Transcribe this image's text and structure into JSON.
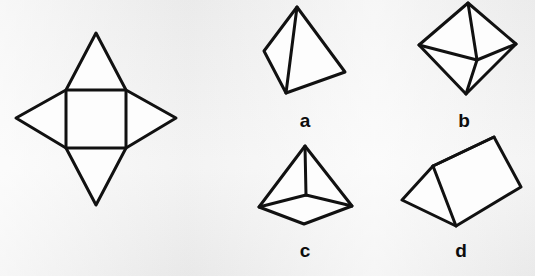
{
  "page": {
    "background_color": "#f1f1f1",
    "ink_color": "#111111",
    "face_fill_color": "#fdfdfd",
    "width": 535,
    "height": 276
  },
  "question_figure": {
    "name": "square-pyramid-net",
    "description": "Net made of a central square with four congruent triangles attached to each side, forming a four-pointed star",
    "shape_type": "net",
    "square": {
      "left": 66,
      "top": 90,
      "right": 126,
      "bottom": 148
    },
    "tips": {
      "top": {
        "x": 96,
        "y": 33
      },
      "right": {
        "x": 176,
        "y": 118
      },
      "bottom": {
        "x": 96,
        "y": 205
      },
      "left": {
        "x": 16,
        "y": 118
      }
    },
    "face_count": 5,
    "triangle_count": 4,
    "square_count": 1
  },
  "options": [
    {
      "id": "a",
      "label": "a",
      "solid_name": "tetrahedron",
      "description": "Triangular pyramid with four triangular faces, tilted",
      "label_position": {
        "x": 305,
        "y": 111
      },
      "vertices": {
        "apex": {
          "x": 297,
          "y": 7
        },
        "left": {
          "x": 264,
          "y": 51
        },
        "front": {
          "x": 286,
          "y": 93
        },
        "right": {
          "x": 345,
          "y": 72
        }
      }
    },
    {
      "id": "b",
      "label": "b",
      "solid_name": "octahedron",
      "description": "Two square pyramids joined base to base, eight triangular faces",
      "label_position": {
        "x": 464,
        "y": 111
      },
      "vertices": {
        "top": {
          "x": 468,
          "y": 3
        },
        "left": {
          "x": 419,
          "y": 45
        },
        "right": {
          "x": 516,
          "y": 44
        },
        "bottom": {
          "x": 466,
          "y": 94
        },
        "center": {
          "x": 477,
          "y": 60
        }
      }
    },
    {
      "id": "c",
      "label": "c",
      "solid_name": "square pyramid",
      "description": "Pyramid with a square base and four triangular faces",
      "label_position": {
        "x": 305,
        "y": 241
      },
      "vertices": {
        "apex": {
          "x": 305,
          "y": 146
        },
        "base_left": {
          "x": 259,
          "y": 207
        },
        "base_right": {
          "x": 352,
          "y": 206
        },
        "base_front": {
          "x": 304,
          "y": 224
        },
        "base_center": {
          "x": 306,
          "y": 195
        }
      }
    },
    {
      "id": "d",
      "label": "d",
      "solid_name": "triangular prism",
      "description": "Prism with two triangular ends and three rectangular faces, lying tilted",
      "label_position": {
        "x": 461,
        "y": 241
      },
      "vertices": {
        "ridge_far": {
          "x": 494,
          "y": 137
        },
        "ridge_near": {
          "x": 433,
          "y": 166
        },
        "front_left": {
          "x": 402,
          "y": 200
        },
        "front_bottom": {
          "x": 456,
          "y": 226
        },
        "back_right": {
          "x": 521,
          "y": 187
        }
      }
    }
  ]
}
